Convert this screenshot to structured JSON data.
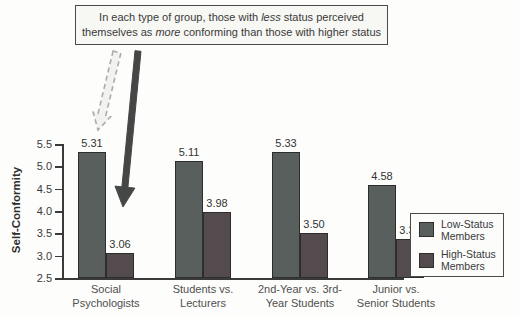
{
  "annotation": {
    "l1a": "In each type of group, those with ",
    "l1b": "less",
    "l1c": " status perceived",
    "l2a": "themselves as ",
    "l2b": "more",
    "l2c": " conforming than those with higher status"
  },
  "chart_data": {
    "type": "bar",
    "categories": [
      "Social Psychologists",
      "Students vs. Lecturers",
      "2nd-Year vs. 3rd-Year Students",
      "Junior vs. Senior Students"
    ],
    "categories_display": [
      [
        "Social",
        "Psychologists"
      ],
      [
        "Students vs.",
        "Lecturers"
      ],
      [
        "2nd-Year vs. 3rd-",
        "Year Students"
      ],
      [
        "Junior vs.",
        "Senior Students"
      ]
    ],
    "series": [
      {
        "name": "Low-Status Members",
        "values": [
          5.31,
          5.11,
          5.33,
          4.58
        ],
        "color": "#585f5d"
      },
      {
        "name": "High-Status Members",
        "values": [
          3.06,
          3.98,
          3.5,
          3.38
        ],
        "color": "#544b4e"
      }
    ],
    "title": "",
    "xlabel": "",
    "ylabel": "Self-Conformity",
    "ylim": [
      2.5,
      5.5
    ],
    "yticks": [
      5.5,
      5.0,
      4.5,
      4.0,
      3.5,
      3.0,
      2.5
    ],
    "grid": false,
    "legend_position": "right"
  },
  "legend": {
    "items": [
      {
        "line1": "Low-Status",
        "line2": "Members",
        "color": "#585f5d"
      },
      {
        "line1": "High-Status",
        "line2": "Members",
        "color": "#544b4e"
      }
    ]
  },
  "colors": {
    "low_status": "#585f5d",
    "high_status": "#544b4e",
    "solid_arrow": "#454747",
    "dashed_arrow_stroke": "#a9adac",
    "dashed_arrow_fill": "#f2f2ef",
    "axis": "#3a3a3a"
  }
}
